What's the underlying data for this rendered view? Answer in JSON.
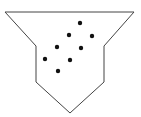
{
  "diagram": {
    "shape": "funnel",
    "outline": {
      "points": "5,12 134,12 104,46 104,82 70,113 36,82 36,46",
      "stroke": "#444444",
      "fill": "#ffffff"
    },
    "particles": [
      {
        "x": 80,
        "y": 23
      },
      {
        "x": 69,
        "y": 35
      },
      {
        "x": 92,
        "y": 36
      },
      {
        "x": 57,
        "y": 47
      },
      {
        "x": 81,
        "y": 48
      },
      {
        "x": 45,
        "y": 59
      },
      {
        "x": 70,
        "y": 60
      },
      {
        "x": 58,
        "y": 71
      }
    ],
    "particle_color": "#111111",
    "particle_count": 8
  }
}
